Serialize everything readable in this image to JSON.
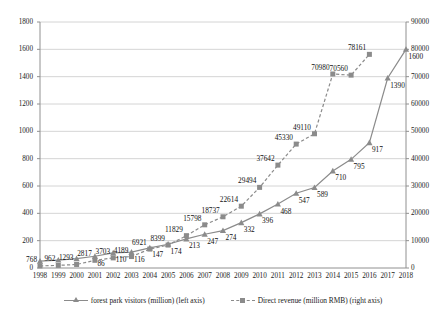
{
  "chart_data": {
    "type": "line",
    "title": "",
    "xlabel": "",
    "categories": [
      "1998",
      "1999",
      "2000",
      "2001",
      "2002",
      "2003",
      "2004",
      "2005",
      "2006",
      "2007",
      "2008",
      "2009",
      "2010",
      "2011",
      "2012",
      "2013",
      "2014",
      "2015",
      "2016",
      "2017",
      "2018"
    ],
    "grid": true,
    "legend_position": "bottom",
    "axes": {
      "left": {
        "label": "forest park visitors (million)",
        "ticks": [
          "0",
          "200",
          "400",
          "600",
          "800",
          "1000",
          "1200",
          "1400",
          "1600",
          "1800"
        ],
        "ylim": [
          0,
          1800
        ],
        "step": 200
      },
      "right": {
        "label": "Direct revenue (million RMB)",
        "ticks": [
          "0",
          "10000",
          "20000",
          "30000",
          "40000",
          "50000",
          "60000",
          "70000",
          "80000",
          "90000"
        ],
        "ylim": [
          0,
          90000
        ],
        "step": 10000
      }
    },
    "series": [
      {
        "name": "forest park visitors (million) (left axis)",
        "axis": "left",
        "marker": "triangle",
        "linestyle": "solid",
        "color": "#8b8b8b",
        "x": [
          "1998",
          "1999",
          "2000",
          "2001",
          "2002",
          "2003",
          "2004",
          "2005",
          "2006",
          "2007",
          "2008",
          "2009",
          "2010",
          "2011",
          "2012",
          "2013",
          "2014",
          "2015",
          "2016",
          "2017",
          "2018"
        ],
        "values": [
          50,
          58,
          68,
          86,
          110,
          116,
          147,
          174,
          213,
          247,
          274,
          332,
          396,
          468,
          547,
          589,
          710,
          795,
          917,
          1390,
          1600
        ],
        "labels": [
          "",
          "",
          "",
          "86",
          "110",
          "116",
          "147",
          "174",
          "213",
          "247",
          "274",
          "332",
          "396",
          "468",
          "547",
          "589",
          "710",
          "795",
          "917",
          "1390",
          "1600"
        ]
      },
      {
        "name": "Direct revenue (million RMB) (right axis)",
        "axis": "right",
        "marker": "square",
        "linestyle": "dashed",
        "color": "#8b8b8b",
        "x": [
          "1998",
          "1999",
          "2000",
          "2001",
          "2002",
          "2003",
          "2004",
          "2005",
          "2006",
          "2007",
          "2008",
          "2009",
          "2010",
          "2011",
          "2012",
          "2013",
          "2014",
          "2015",
          "2016"
        ],
        "values": [
          768,
          962,
          1293,
          2817,
          3703,
          4189,
          6921,
          8399,
          11829,
          15798,
          18737,
          22614,
          29494,
          37642,
          45330,
          49110,
          70980,
          70560,
          78161
        ],
        "labels": [
          "768",
          "962",
          "1293",
          "2817",
          "3703",
          "4189",
          "6921",
          "8399",
          "11829",
          "15798",
          "18737",
          "22614",
          "29494",
          "37642",
          "45330",
          "49110",
          "70980",
          "70560",
          "78161"
        ]
      }
    ]
  },
  "legend": {
    "items": [
      {
        "label": "forest park visitors (million) (left axis)",
        "marker": "triangle-marker",
        "linestyle": "solid"
      },
      {
        "label": "Direct revenue (million RMB) (right axis)",
        "marker": "square-marker",
        "linestyle": "dashed"
      }
    ]
  }
}
